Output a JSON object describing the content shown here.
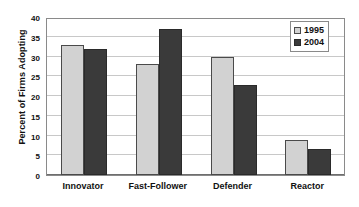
{
  "chart_data": {
    "type": "bar",
    "title": "",
    "xlabel": "",
    "ylabel": "Percent of Firms Adopting",
    "categories": [
      "Innovator",
      "Fast-Follower",
      "Defender",
      "Reactor"
    ],
    "series": [
      {
        "name": "1995",
        "color": "#d2d2d2",
        "values": [
          33.0,
          28.0,
          29.8,
          8.8
        ]
      },
      {
        "name": "2004",
        "color": "#3a3a3a",
        "values": [
          32.0,
          37.0,
          22.8,
          6.6
        ]
      }
    ],
    "ylim": [
      0,
      40
    ],
    "yticks": [
      0,
      5,
      10,
      15,
      20,
      25,
      30,
      35,
      40
    ],
    "ytick_labels": [
      "0",
      "5",
      "10",
      "15",
      "20",
      "25",
      "30",
      "35",
      "40"
    ],
    "grid": true,
    "grid_axis": "y",
    "legend_position": "top-right",
    "legend_entries": [
      "1995",
      "2004"
    ]
  }
}
